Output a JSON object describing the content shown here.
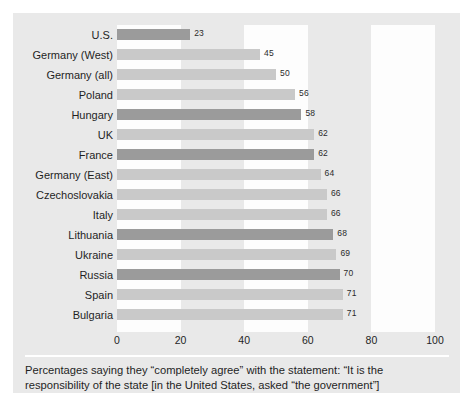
{
  "chart_data": {
    "type": "bar",
    "orientation": "horizontal",
    "title": "",
    "xlabel": "",
    "ylabel": "",
    "xlim": [
      0,
      100
    ],
    "xticks": [
      "0",
      "20",
      "40",
      "60",
      "80",
      "100"
    ],
    "grid": false,
    "legend": null,
    "bands": [
      {
        "from": 0,
        "to": 20
      },
      {
        "from": 40,
        "to": 60
      },
      {
        "from": 80,
        "to": 100
      }
    ],
    "categories": [
      "U.S.",
      "Germany (West)",
      "Germany (all)",
      "Poland",
      "Hungary",
      "UK",
      "France",
      "Germany (East)",
      "Czechoslovakia",
      "Italy",
      "Lithuania",
      "Ukraine",
      "Russia",
      "Spain",
      "Bulgaria"
    ],
    "values": [
      23,
      45,
      50,
      56,
      58,
      62,
      62,
      64,
      66,
      66,
      68,
      69,
      70,
      71,
      71
    ],
    "value_labels": [
      "23",
      "45",
      "50",
      "56",
      "58",
      "62",
      "62",
      "64",
      "66",
      "66",
      "68",
      "69",
      "70",
      "71",
      "71"
    ],
    "shades": [
      "dark",
      "light",
      "light",
      "light",
      "dark",
      "light",
      "dark",
      "light",
      "light",
      "light",
      "dark",
      "light",
      "dark",
      "light",
      "light"
    ]
  },
  "caption": {
    "line1": "Percentages saying they “completely agree” with the statement: “It is the",
    "line2": "responsibility of the state [in the United States, asked “the government”]"
  },
  "colors": {
    "panel": "#e9e9e9",
    "band": "#fdfdfd",
    "bar_dark": "#9b9b9b",
    "bar_light": "#c9c9c9",
    "text": "#1f1f1f"
  }
}
